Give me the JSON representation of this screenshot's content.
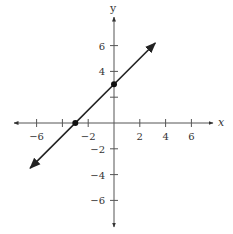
{
  "chart_data": {
    "type": "line",
    "title": "",
    "xlabel": "x",
    "ylabel": "y",
    "xlim": [
      -7.5,
      7.5
    ],
    "ylim": [
      -7.5,
      7.5
    ],
    "grid": false,
    "x_ticks": [
      -6,
      -4,
      -2,
      2,
      4,
      6
    ],
    "y_ticks": [
      -6,
      -4,
      -2,
      2,
      4,
      6
    ],
    "x_tick_labels": [
      "−6",
      "",
      "−2",
      "2",
      "4",
      "6"
    ],
    "y_tick_labels": [
      "6",
      "4",
      "",
      "−2",
      "−4",
      "−6"
    ],
    "series": [
      {
        "name": "y = x + 3",
        "equation": "y = x + 3",
        "x": [
          -6.5,
          3.2
        ],
        "y": [
          -3.5,
          6.2
        ],
        "arrows_both_ends": true
      }
    ],
    "points": [
      {
        "x": -3,
        "y": 0,
        "label": "x-intercept"
      },
      {
        "x": 0,
        "y": 3,
        "label": "y-intercept"
      }
    ]
  }
}
